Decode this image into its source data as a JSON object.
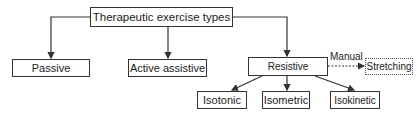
{
  "diagram": {
    "root": "Therapeutic exercise types",
    "level1": [
      "Passive",
      "Active assistive",
      "Resistive"
    ],
    "resistive_children": [
      "Isotonic",
      "Isometric",
      "Isokinetic"
    ],
    "side_link": {
      "label": "Manual",
      "target": "Stretching",
      "style": "dashed"
    }
  }
}
